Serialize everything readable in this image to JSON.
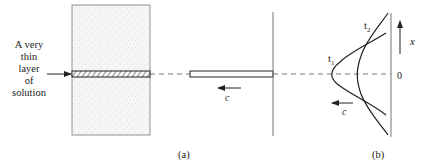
{
  "figure": {
    "annotation_lines": [
      "A very",
      "thin",
      "layer",
      "of",
      "solution"
    ],
    "panel_a_label": "(a)",
    "panel_b_label": "(b)",
    "velocity_label_a": "c",
    "velocity_label_b": "c",
    "curve_t1_label": "t",
    "curve_t1_sub": "1",
    "curve_t2_label": "t",
    "curve_t2_sub": "2",
    "axis_label": "x",
    "origin_label": "0"
  },
  "colors": {
    "stroke": "#222222",
    "gray_line": "#777777",
    "stipple_fill": "#f4f4f4",
    "stipple_dots": "#b5b5b5"
  }
}
